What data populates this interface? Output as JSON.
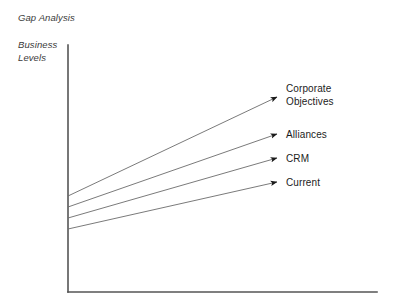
{
  "chart_data": {
    "type": "line",
    "title": "Gap Analysis",
    "ylabel_line1": "Business",
    "ylabel_line2": "Levels",
    "xlabel": "",
    "grid": false,
    "legend_position": "inline-right-end-labels",
    "axis": {
      "y_top": 45,
      "y_bottom": 292,
      "x_left": 68,
      "x_right": 377,
      "color": "#555555"
    },
    "series": [
      {
        "name": "Corporate Objectives",
        "label_line1": "Corporate",
        "label_line2": "Objectives",
        "start": {
          "x": 68,
          "y": 196
        },
        "end": {
          "x": 277,
          "y": 97
        },
        "label_x": 286,
        "label_y1": 92,
        "label_y2": 105,
        "arrow": true,
        "color": "#6b6b6b"
      },
      {
        "name": "Alliances",
        "label_line1": "Alliances",
        "label_line2": "",
        "start": {
          "x": 68,
          "y": 207
        },
        "end": {
          "x": 277,
          "y": 134
        },
        "label_x": 286,
        "label_y1": 138,
        "label_y2": 0,
        "arrow": true,
        "color": "#6b6b6b"
      },
      {
        "name": "CRM",
        "label_line1": "CRM",
        "label_line2": "",
        "start": {
          "x": 68,
          "y": 218
        },
        "end": {
          "x": 277,
          "y": 158
        },
        "label_x": 286,
        "label_y1": 162,
        "label_y2": 0,
        "arrow": true,
        "color": "#6b6b6b"
      },
      {
        "name": "Current",
        "label_line1": "Current",
        "label_line2": "",
        "start": {
          "x": 68,
          "y": 229
        },
        "end": {
          "x": 277,
          "y": 182
        },
        "label_x": 286,
        "label_y1": 186,
        "label_y2": 0,
        "arrow": true,
        "color": "#6b6b6b"
      }
    ],
    "title_position": {
      "x": 18,
      "y": 21
    },
    "ylabel_position": {
      "x": 18,
      "y": 48,
      "y2": 61
    },
    "background_color": "#ffffff",
    "text_color": "#1c1c1c"
  }
}
